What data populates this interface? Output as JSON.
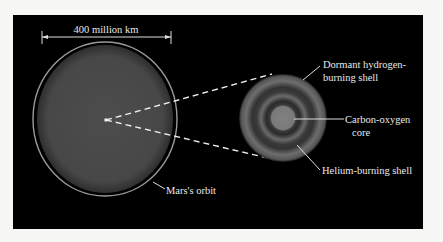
{
  "figure": {
    "scale_label": "400 million km",
    "orbit_label": "Mars's orbit",
    "labels": {
      "dormant_line1": "Dormant hydrogen-",
      "dormant_line2": "burning shell",
      "core_line1": "Carbon-oxygen",
      "core_line2": "core",
      "helium": "Helium-burning shell"
    },
    "colors": {
      "background": "#000000",
      "star_fill": "#4a4a4a",
      "orbit_ring": "#9a9a9a",
      "core_fill": "#8a8a8a",
      "text": "#e8e8e8"
    }
  }
}
